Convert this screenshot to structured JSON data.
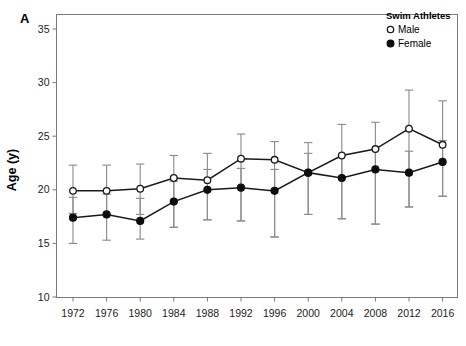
{
  "figure": {
    "panel_label": "A"
  },
  "legend": {
    "title": "Swim Athletes",
    "entries": [
      {
        "label": "Male",
        "marker": "open-circle"
      },
      {
        "label": "Female",
        "marker": "filled-circle"
      }
    ]
  },
  "chart_data": {
    "type": "line",
    "title": "",
    "subtitle": "",
    "xlabel": "",
    "ylabel": "Age (y)",
    "xlim": [
      1970,
      2018
    ],
    "ylim": [
      10,
      35
    ],
    "yticks": [
      10,
      15,
      20,
      25,
      30,
      35
    ],
    "ytick_labels": [
      "10",
      "15",
      "20",
      "25",
      "30",
      "35"
    ],
    "grid": false,
    "legend_position": "top-right",
    "error_bars": "vertical capped (SD)",
    "categories": [
      1972,
      1976,
      1980,
      1984,
      1988,
      1992,
      1996,
      2000,
      2004,
      2008,
      2012,
      2016
    ],
    "xtick_labels": [
      "1972",
      "1976",
      "1980",
      "1984",
      "1988",
      "1992",
      "1996",
      "2000",
      "2004",
      "2008",
      "2012",
      "2016"
    ],
    "series": [
      {
        "name": "Male",
        "marker": "open-circle",
        "values": [
          19.9,
          19.9,
          20.1,
          21.1,
          20.9,
          22.9,
          22.8,
          21.6,
          23.2,
          23.8,
          25.7,
          24.2
        ],
        "err_upper": [
          22.3,
          22.3,
          22.4,
          23.2,
          23.4,
          25.2,
          24.5,
          24.4,
          26.1,
          26.3,
          29.3,
          28.3
        ],
        "err_lower": [
          17.8,
          17.7,
          17.7,
          16.5,
          17.2,
          17.1,
          15.6,
          17.7,
          17.3,
          16.8,
          18.4,
          19.4
        ]
      },
      {
        "name": "Female",
        "marker": "filled-circle",
        "values": [
          17.4,
          17.7,
          17.1,
          18.9,
          20.0,
          20.2,
          19.9,
          21.6,
          21.1,
          21.9,
          21.6,
          22.6
        ],
        "err_upper": [
          19.3,
          19.6,
          19.2,
          20.8,
          21.9,
          22.0,
          21.9,
          23.4,
          23.2,
          23.8,
          23.6,
          24.6
        ],
        "err_lower": [
          15.0,
          15.3,
          15.4,
          16.5,
          17.2,
          17.1,
          15.6,
          17.7,
          17.3,
          16.8,
          18.4,
          19.4
        ]
      }
    ]
  }
}
